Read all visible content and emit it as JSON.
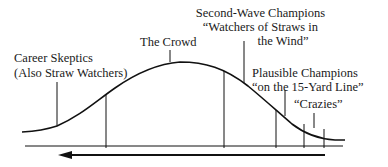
{
  "diagram": {
    "labels": {
      "career_skeptics": [
        "Career Skeptics",
        "(Also Straw Watchers)"
      ],
      "the_crowd": [
        "The Crowd"
      ],
      "second_wave": [
        "Second-Wave Champions",
        "“Watchers of Straws in",
        "the Wind”"
      ],
      "plausible": [
        "Plausible Champions",
        "“on the 15-Yard Line”"
      ],
      "crazies": [
        "“Crazies”"
      ]
    },
    "arrow_direction": "left",
    "colors": {
      "ink": "#111111",
      "background": "#ffffff"
    }
  }
}
